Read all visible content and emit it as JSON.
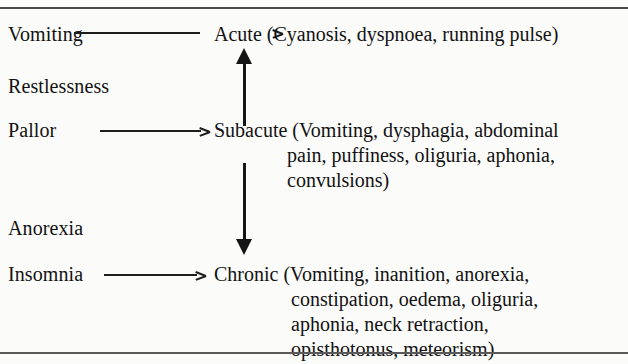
{
  "figure": {
    "symptoms": [
      {
        "label": "Vomiting"
      },
      {
        "label": "Restlessness"
      },
      {
        "label": "Pallor"
      },
      {
        "label": "Anorexia"
      },
      {
        "label": "Insomnia"
      }
    ],
    "stages": {
      "acute": {
        "lines": [
          "Acute (Cyanosis, dyspnoea, running pulse)"
        ]
      },
      "subacute": {
        "lines": [
          "Subacute (Vomiting, dysphagia, abdominal",
          "pain, puffiness, oliguria, aphonia,",
          "convulsions)"
        ]
      },
      "chronic": {
        "lines": [
          "Chronic (Vomiting, inanition, anorexia,",
          "constipation, oedema, oliguria,",
          "aphonia, neck retraction,",
          "opisthotonus, meteorism)"
        ]
      }
    },
    "colors": {
      "ink": "#121212",
      "rule": "#4a4a4a",
      "arrow": "#151515",
      "background": "#fbfbfa"
    }
  }
}
